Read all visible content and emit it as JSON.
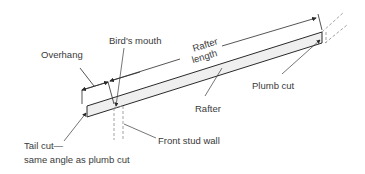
{
  "diagram": {
    "labels": {
      "overhang": "Overhang",
      "birds_mouth": "Bird's mouth",
      "rafter_length_line1": "Rafter",
      "rafter_length_line2": "length",
      "plumb_cut": "Plumb cut",
      "rafter": "Rafter",
      "front_stud_wall": "Front stud wall",
      "tail_cut_line1": "Tail cut—",
      "tail_cut_line2": "same angle as plumb cut"
    },
    "colors": {
      "line": "#2a2a2a",
      "rafter_fill": "#efefef",
      "dashed": "#8a8a8a"
    }
  }
}
